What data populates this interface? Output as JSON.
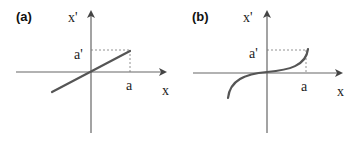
{
  "panels": [
    {
      "id": "a",
      "label": "(a)",
      "curve_type": "linear",
      "y_axis_label": "x'",
      "x_axis_label": "x",
      "x_marker_label": "a",
      "y_marker_label": "a'"
    },
    {
      "id": "b",
      "label": "(b)",
      "curve_type": "cubic (odd, S-shaped)",
      "y_axis_label": "x'",
      "x_axis_label": "x",
      "x_marker_label": "a",
      "y_marker_label": "a'"
    }
  ],
  "colors": {
    "axis": "#666666",
    "curve": "#555555",
    "dashed": "#777777",
    "text": "#222222"
  }
}
